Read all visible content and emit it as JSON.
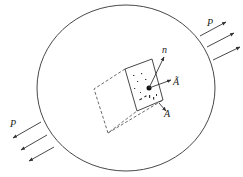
{
  "diagram": {
    "type": "free-body stress element in a loaded body",
    "colors": {
      "stroke": "#333333",
      "background": "#ffffff"
    },
    "body": {
      "shape": "ellipse",
      "cx": 126,
      "cy": 88,
      "rx": 89,
      "ry": 83
    },
    "labels": {
      "force_right": "P",
      "force_left": "P",
      "normal": "n",
      "area_vector": "Ã",
      "area": "A"
    },
    "forces": {
      "right": [
        {
          "x1": 200,
          "y1": 36,
          "x2": 226,
          "y2": 22
        },
        {
          "x1": 207,
          "y1": 47,
          "x2": 234,
          "y2": 33
        },
        {
          "x1": 213,
          "y1": 60,
          "x2": 240,
          "y2": 47
        }
      ],
      "left": [
        {
          "x1": 41,
          "y1": 122,
          "x2": 13,
          "y2": 138
        },
        {
          "x1": 47,
          "y1": 135,
          "x2": 21,
          "y2": 150
        },
        {
          "x1": 54,
          "y1": 147,
          "x2": 29,
          "y2": 161
        }
      ]
    },
    "element": {
      "front_face": "125,69 152,59 163,100 137,111",
      "hidden_edges": "125,69 94,89 108,133 137,111",
      "hidden_edge_extra": "108,133 163,100",
      "centroid": {
        "cx": 149,
        "cy": 88,
        "r": 2.5
      }
    },
    "vectors": {
      "normal": {
        "x1": 149,
        "y1": 88,
        "x2": 164,
        "y2": 57
      },
      "area_vector": {
        "x1": 149,
        "y1": 88,
        "x2": 171,
        "y2": 80
      },
      "area": {
        "x1": 159,
        "y1": 103,
        "x2": 166,
        "y2": 111
      }
    }
  }
}
